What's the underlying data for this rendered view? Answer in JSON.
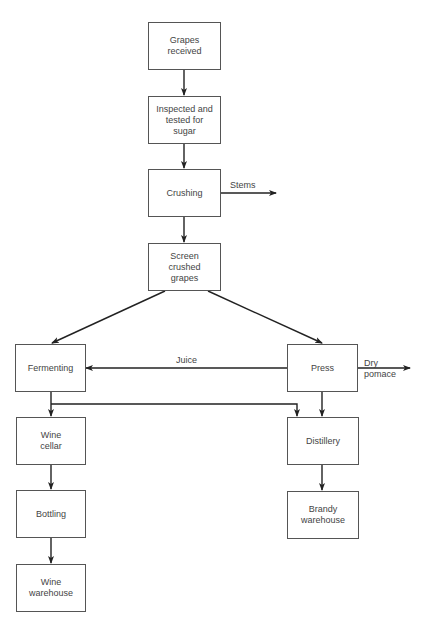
{
  "diagram": {
    "type": "flowchart",
    "title": "",
    "nodes": [
      {
        "id": "grapes_received",
        "label": "Grapes\nreceived"
      },
      {
        "id": "inspected",
        "label": "Inspected and\ntested for\nsugar"
      },
      {
        "id": "crushing",
        "label": "Crushing"
      },
      {
        "id": "screen",
        "label": "Screen\ncrushed\ngrapes"
      },
      {
        "id": "fermenting",
        "label": "Fermenting"
      },
      {
        "id": "press",
        "label": "Press"
      },
      {
        "id": "wine_cellar",
        "label": "Wine\ncellar"
      },
      {
        "id": "distillery",
        "label": "Distillery"
      },
      {
        "id": "bottling",
        "label": "Bottling"
      },
      {
        "id": "brandy_warehouse",
        "label": "Brandy\nwarehouse"
      },
      {
        "id": "wine_warehouse",
        "label": "Wine\nwarehouse"
      }
    ],
    "edge_labels": {
      "stems": "Stems",
      "juice": "Juice",
      "dry_pomace": "Dry\npomace"
    },
    "edges": [
      {
        "from": "grapes_received",
        "to": "inspected"
      },
      {
        "from": "inspected",
        "to": "crushing"
      },
      {
        "from": "crushing",
        "to": "stems_out",
        "label": "Stems"
      },
      {
        "from": "crushing",
        "to": "screen"
      },
      {
        "from": "screen",
        "to": "fermenting"
      },
      {
        "from": "screen",
        "to": "press"
      },
      {
        "from": "press",
        "to": "fermenting",
        "label": "Juice"
      },
      {
        "from": "press",
        "to": "pomace_out",
        "label": "Dry pomace"
      },
      {
        "from": "fermenting",
        "to": "wine_cellar"
      },
      {
        "from": "fermenting",
        "to": "distillery"
      },
      {
        "from": "press",
        "to": "distillery"
      },
      {
        "from": "wine_cellar",
        "to": "bottling"
      },
      {
        "from": "bottling",
        "to": "wine_warehouse"
      },
      {
        "from": "distillery",
        "to": "brandy_warehouse"
      }
    ]
  }
}
